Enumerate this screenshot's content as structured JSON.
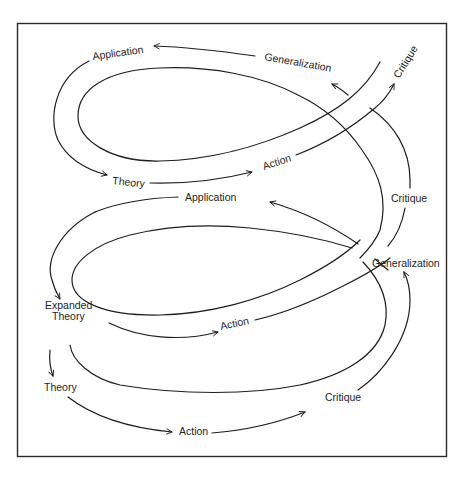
{
  "diagram": {
    "colors": {
      "stroke": "#1e1e1e",
      "background": "#ffffff",
      "frame": "#2a2a2a"
    },
    "labels": {
      "top_application": "Application",
      "top_generalization": "Generalization",
      "top_critique": "Critique",
      "top_theory": "Theory",
      "top_action": "Action",
      "mid_application": "Application",
      "mid_critique": "Critique",
      "mid_generalization": "Generalization",
      "mid_expanded_theory_line1": "Expanded",
      "mid_expanded_theory_line2": "Theory",
      "mid_action": "Action",
      "bottom_theory": "Theory",
      "bottom_action": "Action",
      "bottom_critique": "Critique"
    }
  }
}
